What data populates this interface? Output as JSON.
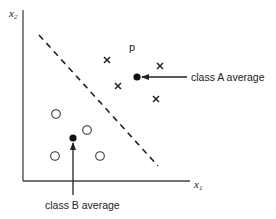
{
  "diagram": {
    "type": "scatter-classification",
    "axes": {
      "x_label": "x",
      "x_subscript": "1",
      "y_label": "x",
      "y_subscript": "2",
      "origin": [
        23,
        181
      ],
      "x_end": 190,
      "y_top": 10
    },
    "decision_boundary": {
      "style": "dashed",
      "from": [
        39,
        35
      ],
      "to": [
        158,
        166
      ]
    },
    "class_A": {
      "marker": "cross",
      "points": [
        [
          107,
          60
        ],
        [
          118,
          86
        ],
        [
          160,
          66
        ],
        [
          156,
          99
        ]
      ],
      "average": [
        137,
        77
      ],
      "average_label": "class A average"
    },
    "class_B": {
      "marker": "circle",
      "points": [
        [
          56,
          114
        ],
        [
          87,
          130
        ],
        [
          55,
          156
        ],
        [
          100,
          156
        ]
      ],
      "average": [
        73,
        138
      ],
      "average_label": "class B average"
    },
    "point_label": "p",
    "colors": {
      "ink": "#222222",
      "background": "#ffffff"
    }
  }
}
